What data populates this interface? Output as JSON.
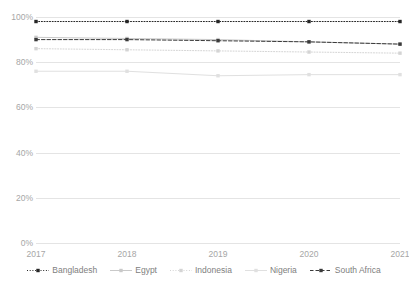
{
  "chart_data": {
    "type": "line",
    "title": "",
    "xlabel": "",
    "ylabel": "",
    "categories": [
      "2017",
      "2018",
      "2019",
      "2020",
      "2021"
    ],
    "x": [
      2017,
      2018,
      2019,
      2020,
      2021
    ],
    "ylim": [
      0,
      100
    ],
    "yticks": [
      0,
      20,
      40,
      60,
      80,
      100
    ],
    "ytick_labels": [
      "0%",
      "20%",
      "40%",
      "60%",
      "80%",
      "100%"
    ],
    "grid": true,
    "legend_position": "bottom",
    "units": "percent",
    "series": [
      {
        "name": "Bangladesh",
        "values": [
          98,
          98,
          98,
          98,
          98
        ],
        "color": "#262626",
        "line_style": "dotted",
        "marker": "square"
      },
      {
        "name": "Egypt",
        "values": [
          91,
          90.5,
          90,
          89,
          88
        ],
        "color": "#c9c9c9",
        "line_style": "solid",
        "marker": "square"
      },
      {
        "name": "Indonesia",
        "values": [
          86,
          85.5,
          85,
          84.5,
          84
        ],
        "color": "#d4d4d4",
        "line_style": "dotted",
        "marker": "square"
      },
      {
        "name": "Nigeria",
        "values": [
          76,
          76,
          74,
          74.5,
          74.5
        ],
        "color": "#e0e0e0",
        "line_style": "solid",
        "marker": "square"
      },
      {
        "name": "South Africa",
        "values": [
          90,
          90,
          89.5,
          89,
          88
        ],
        "color": "#3a3a3a",
        "line_style": "dashed",
        "marker": "square"
      }
    ]
  },
  "axis": {
    "y_labels": [
      "100%",
      "80%",
      "60%",
      "40%",
      "20%",
      "0%"
    ],
    "x_labels": [
      "2017",
      "2018",
      "2019",
      "2020",
      "2021"
    ]
  },
  "legend": {
    "items": [
      {
        "label": "Bangladesh"
      },
      {
        "label": "Egypt"
      },
      {
        "label": "Indonesia"
      },
      {
        "label": "Nigeria"
      },
      {
        "label": "South Africa"
      }
    ]
  },
  "colors": {
    "grid": "#e4e4e4",
    "axis_text": "#a6a6a6",
    "legend_text": "#808080",
    "background": "#ffffff"
  }
}
